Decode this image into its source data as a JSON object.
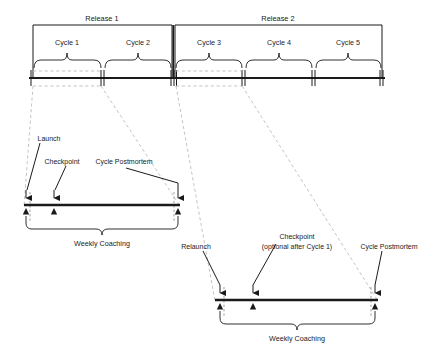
{
  "diagram": {
    "colors": {
      "ink": "#1a1a1a",
      "guide_dashed": "#b9b9b9",
      "tick_dashed": "#8f8f8f",
      "background": "#ffffff"
    }
  },
  "timeline": {
    "releases": [
      {
        "label": "Release 1",
        "x_start": 33,
        "x_end": 172,
        "label_x": 102
      },
      {
        "label": "Release 2",
        "x_start": 175,
        "x_end": 382,
        "label_x": 278
      }
    ],
    "cycles": [
      {
        "label": "Cycle 1",
        "x_start": 33,
        "x_end": 102,
        "label_x": 67
      },
      {
        "label": "Cycle 2",
        "x_start": 104,
        "x_end": 172,
        "label_x": 138
      },
      {
        "label": "Cycle 3",
        "x_start": 175,
        "x_end": 243,
        "label_x": 209
      },
      {
        "label": "Cycle 4",
        "x_start": 245,
        "x_end": 313,
        "label_x": 279
      },
      {
        "label": "Cycle 5",
        "x_start": 315,
        "x_end": 382,
        "label_x": 348
      }
    ],
    "axis_y": 78,
    "axis_x_start": 29,
    "axis_x_end": 385,
    "boundary_ticks": [
      102,
      172,
      175,
      243,
      313,
      382
    ]
  },
  "detail_left": {
    "source_cycle": "Cycle 1",
    "bar": {
      "x_start": 24,
      "x_end": 180,
      "y": 205
    },
    "annotations": [
      {
        "label": "Launch",
        "text_x": 49,
        "text_y": 139,
        "marker_x": 26,
        "arrow_kind": "down-arrow-and-up-triangle"
      },
      {
        "label": "Checkpoint",
        "text_x": 62,
        "text_y": 162,
        "marker_x": 54,
        "arrow_kind": "down-arrow-and-up-triangle"
      },
      {
        "label": "Cycle Postmortem",
        "text_x": 124,
        "text_y": 162,
        "marker_x": 178,
        "arrow_kind": "down-arrow-and-up-triangle"
      }
    ],
    "brace": {
      "label": "Weekly Coaching",
      "x_start": 26,
      "x_end": 178,
      "y_top": 216,
      "label_x": 102,
      "label_y": 245
    }
  },
  "detail_right": {
    "source_cycle": "Cycle 3",
    "bar": {
      "x_start": 215,
      "x_end": 378,
      "y": 300
    },
    "annotations": [
      {
        "label": "Relaunch",
        "text_x": 196,
        "text_y": 247,
        "marker_x": 220,
        "arrow_kind": "down-arrow-and-up-triangle"
      },
      {
        "label": "Checkpoint",
        "label_line_2": "(optional after Cycle 1)",
        "text_x": 297,
        "text_y": 237,
        "marker_x": 253,
        "arrow_kind": "down-arrow-and-up-triangle"
      },
      {
        "label": "Cycle Postmortem",
        "text_x": 389,
        "text_y": 247,
        "marker_x": 375,
        "arrow_kind": "down-arrow-and-up-triangle"
      }
    ],
    "brace": {
      "label": "Weekly Coaching",
      "x_start": 220,
      "x_end": 375,
      "y_top": 311,
      "label_x": 297,
      "label_y": 340
    }
  },
  "connectors": {
    "left_detail_fan": [
      {
        "from_x": 33,
        "from_y": 86,
        "to_x": 24,
        "to_y": 206
      },
      {
        "from_x": 102,
        "from_y": 86,
        "to_x": 180,
        "to_y": 206
      }
    ],
    "right_detail_fan": [
      {
        "from_x": 175,
        "from_y": 86,
        "to_x": 215,
        "to_y": 301
      },
      {
        "from_x": 243,
        "from_y": 86,
        "to_x": 378,
        "to_y": 301
      }
    ]
  }
}
